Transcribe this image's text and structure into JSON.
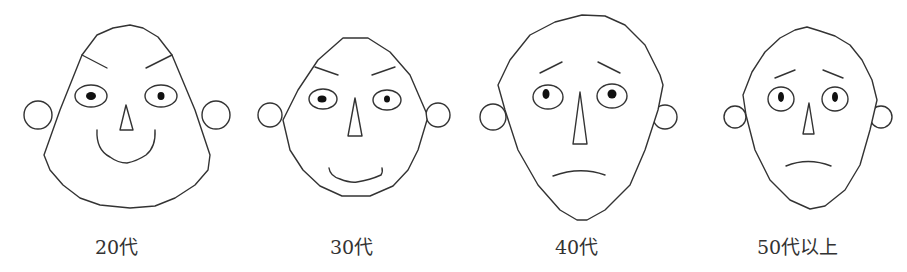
{
  "figure": {
    "stroke_color": "#333333",
    "labels": {
      "face_20s": "20代",
      "face_30s": "30代",
      "face_40s": "40代",
      "face_50s": "50代以上"
    },
    "faces": [
      {
        "age_group": "20代",
        "expression": "smiling, angled-down brows"
      },
      {
        "age_group": "30代",
        "expression": "slight smile, angled-down brows"
      },
      {
        "age_group": "40代",
        "expression": "frown, raised worried brows"
      },
      {
        "age_group": "50代以上",
        "expression": "frown, raised worried brows"
      }
    ]
  }
}
